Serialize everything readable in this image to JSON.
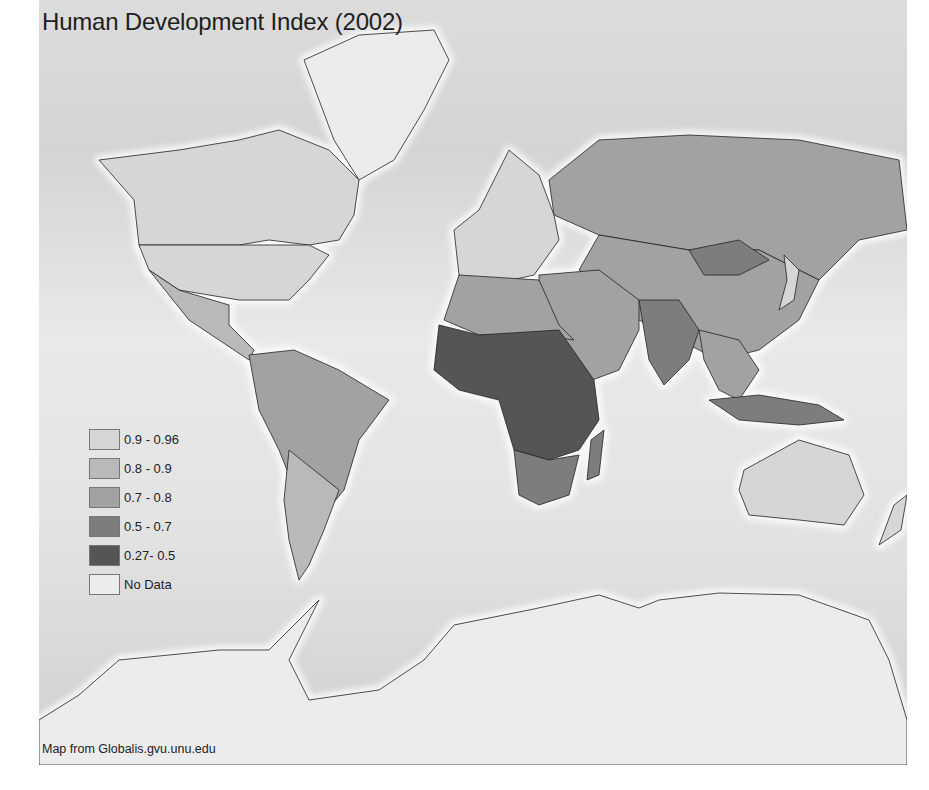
{
  "title": "Human Development Index (2002)",
  "credit": "Map from Globalis.gvu.unu.edu",
  "legend": [
    {
      "label": "0.9 - 0.96",
      "color": "#d6d6d6"
    },
    {
      "label": "0.8 - 0.9",
      "color": "#b9b9b9"
    },
    {
      "label": "0.7 - 0.8",
      "color": "#a2a2a2"
    },
    {
      "label": "0.5 - 0.7",
      "color": "#7d7d7d"
    },
    {
      "label": "0.27- 0.5",
      "color": "#555555"
    },
    {
      "label": "No Data",
      "color": "#ececec"
    }
  ],
  "regions": [
    {
      "name": "canada",
      "class": "0.9 - 0.96"
    },
    {
      "name": "greenland",
      "class": "No Data"
    },
    {
      "name": "usa",
      "class": "0.9 - 0.96"
    },
    {
      "name": "mexico-central-america",
      "class": "0.8 - 0.9"
    },
    {
      "name": "south-america",
      "class": "0.7 - 0.8"
    },
    {
      "name": "argentina-chile",
      "class": "0.8 - 0.9"
    },
    {
      "name": "europe",
      "class": "0.9 - 0.96"
    },
    {
      "name": "russia",
      "class": "0.7 - 0.8"
    },
    {
      "name": "china-central-asia",
      "class": "0.7 - 0.8"
    },
    {
      "name": "mongolia",
      "class": "0.5 - 0.7"
    },
    {
      "name": "middle-east",
      "class": "0.7 - 0.8"
    },
    {
      "name": "north-africa",
      "class": "0.7 - 0.8"
    },
    {
      "name": "sub-saharan-africa",
      "class": "0.27- 0.5"
    },
    {
      "name": "southern-africa",
      "class": "0.5 - 0.7"
    },
    {
      "name": "madagascar",
      "class": "0.5 - 0.7"
    },
    {
      "name": "south-asia",
      "class": "0.5 - 0.7"
    },
    {
      "name": "southeast-asia",
      "class": "0.7 - 0.8"
    },
    {
      "name": "japan",
      "class": "0.9 - 0.96"
    },
    {
      "name": "indonesia-png",
      "class": "0.5 - 0.7"
    },
    {
      "name": "australia",
      "class": "0.9 - 0.96"
    },
    {
      "name": "new-zealand",
      "class": "0.9 - 0.96"
    },
    {
      "name": "antarctica",
      "class": "No Data"
    }
  ]
}
